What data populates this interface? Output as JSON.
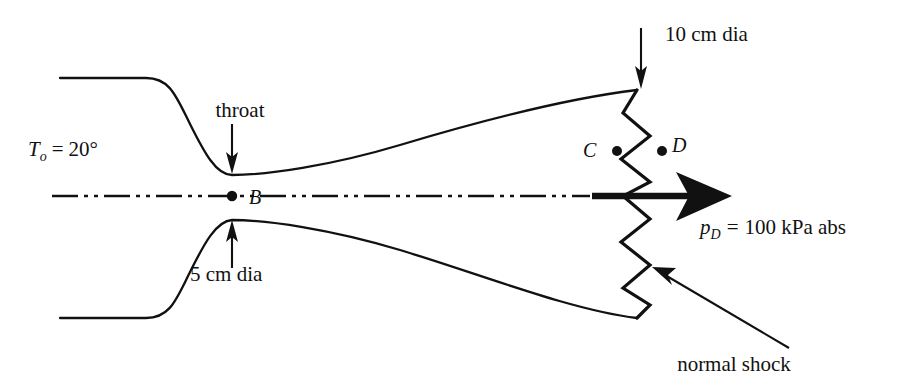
{
  "figure": {
    "name": "converging-diverging-nozzle-with-normal-shock",
    "background_color": "#ffffff",
    "ink_color": "#111111",
    "width": 903,
    "height": 390
  },
  "labels": {
    "stagnation_temperature": {
      "symbol": "T",
      "subscript": "o",
      "equals": "=",
      "value": "20°",
      "full_text": "Tₒ = 20°",
      "x": 28,
      "y": 156
    },
    "throat": {
      "text": "throat",
      "x": 240,
      "y": 117
    },
    "throat_diameter": {
      "text": "5 cm dia",
      "x": 190,
      "y": 281
    },
    "exit_diameter": {
      "text": "10 cm dia",
      "x": 665,
      "y": 41
    },
    "exit_pressure": {
      "symbol": "p",
      "subscript": "D",
      "equals": "=",
      "value": "100 kPa abs",
      "full_text": "p_D = 100 kPa abs",
      "x": 700,
      "y": 234
    },
    "normal_shock": {
      "text": "normal shock",
      "x": 734,
      "y": 371
    },
    "point_b": {
      "text": "B",
      "x": 249,
      "y": 204
    },
    "point_c": {
      "text": "C",
      "x": 583,
      "y": 157
    },
    "point_d": {
      "text": "D",
      "x": 672,
      "y": 152
    }
  },
  "geometry": {
    "upper_wall_path": "M 60 78 L 146 78 C 170 78 176 96 190 124 C 204 152 216 175 232 175 C 266 175 330 166 400 145 C 480 121 570 98 637 90",
    "lower_wall_path": "M 60 318 L 146 318 C 170 318 176 300 190 272 C 204 244 216 221 232 220 C 266 220 330 229 400 250 C 480 274 570 310 637 318",
    "centerline": {
      "x1": 52,
      "y1": 196,
      "x2": 590,
      "y2": 196
    },
    "shock_zigzag": "M 637 90 L 623 113 L 650 136 L 621 159 L 650 182 L 623 196 L 650 219 L 621 242 L 650 265 L 623 288 L 650 305 L 637 318",
    "flow_arrow": {
      "x_start": 592,
      "y": 196,
      "x_tip": 732
    },
    "throat_point_b": {
      "cx": 232,
      "cy": 196,
      "r": 5.2
    },
    "point_c_dot": {
      "cx": 617,
      "cy": 151,
      "r": 5.0
    },
    "point_d_dot": {
      "cx": 662,
      "cy": 151,
      "r": 5.0
    },
    "throat_arrow_down": {
      "x": 232,
      "y_start": 124,
      "y_end": 173
    },
    "throat_arrow_up": {
      "x": 232,
      "y_start": 268,
      "y_end": 221
    },
    "exit_arrow_down": {
      "x": 641,
      "y_start": 28,
      "y_end": 88
    },
    "shock_arrow": {
      "x_start": 789,
      "y_start": 348,
      "x_end": 653,
      "y_end": 268
    }
  }
}
